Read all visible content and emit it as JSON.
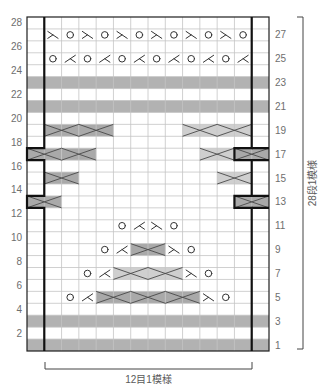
{
  "diagram": {
    "columns_total": 14,
    "rows_total": 28,
    "width_label": "12目1模様",
    "height_label": "28段1模様",
    "left_row_numbers": [
      "28",
      "26",
      "24",
      "22",
      "20",
      "18",
      "16",
      "14",
      "12",
      "10",
      "8",
      "6",
      "4",
      "2"
    ],
    "right_row_numbers": [
      "27",
      "25",
      "23",
      "21",
      "19",
      "17",
      "15",
      "13",
      "11",
      "9",
      "7",
      "5",
      "3",
      "1"
    ],
    "shaded_rows": [
      23,
      21,
      3,
      1
    ],
    "symbol_rows": [
      {
        "row": 27,
        "cells": [
          "",
          "ssk",
          "yo",
          "ssk",
          "yo",
          "ssk",
          "yo",
          "ssk",
          "yo",
          "ssk",
          "yo",
          "ssk",
          "yo",
          ""
        ]
      },
      {
        "row": 25,
        "cells": [
          "",
          "yo",
          "k2tog",
          "yo",
          "k2tog",
          "yo",
          "k2tog",
          "yo",
          "k2tog",
          "yo",
          "k2tog",
          "yo",
          "k2tog",
          ""
        ]
      },
      {
        "row": 11,
        "cells": [
          "",
          "",
          "",
          "",
          "",
          "yo",
          "k2tog",
          "ssk",
          "yo",
          "",
          "",
          "",
          "",
          ""
        ]
      },
      {
        "row": 9,
        "cells": [
          "",
          "",
          "",
          "",
          "yo",
          "k2tog",
          "",
          "",
          "ssk",
          "yo",
          "",
          "",
          "",
          ""
        ]
      },
      {
        "row": 7,
        "cells": [
          "",
          "",
          "",
          "yo",
          "k2tog",
          "",
          "",
          "",
          "",
          "ssk",
          "yo",
          "",
          "",
          ""
        ]
      },
      {
        "row": 5,
        "cells": [
          "",
          "",
          "yo",
          "k2tog",
          "",
          "",
          "",
          "",
          "",
          "",
          "ssk",
          "yo",
          "",
          ""
        ]
      }
    ],
    "cables": [
      {
        "row": 19,
        "start_col": 1,
        "span": 2,
        "shade": "dark"
      },
      {
        "row": 19,
        "start_col": 3,
        "span": 2,
        "shade": "dark"
      },
      {
        "row": 19,
        "start_col": 9,
        "span": 2,
        "shade": "light"
      },
      {
        "row": 19,
        "start_col": 11,
        "span": 2,
        "shade": "light"
      },
      {
        "row": 17,
        "start_col": 0,
        "span": 2,
        "shade": "dark"
      },
      {
        "row": 17,
        "start_col": 2,
        "span": 2,
        "shade": "dark"
      },
      {
        "row": 17,
        "start_col": 10,
        "span": 2,
        "shade": "light"
      },
      {
        "row": 17,
        "start_col": 12,
        "span": 2,
        "shade": "dark"
      },
      {
        "row": 15,
        "start_col": 1,
        "span": 2,
        "shade": "dark"
      },
      {
        "row": 15,
        "start_col": 11,
        "span": 2,
        "shade": "light"
      },
      {
        "row": 13,
        "start_col": 0,
        "span": 2,
        "shade": "dark"
      },
      {
        "row": 13,
        "start_col": 12,
        "span": 2,
        "shade": "dark"
      },
      {
        "row": 9,
        "start_col": 6,
        "span": 2,
        "shade": "dark"
      },
      {
        "row": 7,
        "start_col": 5,
        "span": 2,
        "shade": "light"
      },
      {
        "row": 7,
        "start_col": 7,
        "span": 2,
        "shade": "light"
      },
      {
        "row": 5,
        "start_col": 4,
        "span": 2,
        "shade": "dark"
      },
      {
        "row": 5,
        "start_col": 6,
        "span": 2,
        "shade": "dark"
      },
      {
        "row": 5,
        "start_col": 8,
        "span": 2,
        "shade": "dark"
      }
    ],
    "repeat": {
      "start_col": 1,
      "end_col": 12,
      "shifted_rows": [
        17,
        13
      ],
      "shift": -1
    },
    "colors": {
      "band": "#b2b2b2",
      "cable_dark": "#a9a9a9",
      "cable_light": "#cfcfcf",
      "grid": "#c4c4c4",
      "border": "#1e1e1e",
      "repeat_line": "#111111",
      "symbol": "#333333",
      "cross_line": "#4a4a4a",
      "bracket": "#444444"
    }
  }
}
